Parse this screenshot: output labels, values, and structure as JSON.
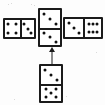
{
  "figure": {
    "background_color": "#fdfdfd",
    "ink_color": "#1b1b1b",
    "pip_color": "#101010"
  },
  "dominoes": [
    {
      "id": "left-domino",
      "name": "left-domino",
      "orientation": "horizontal",
      "position": "cross-left",
      "x": 3,
      "y": 18,
      "width": 33,
      "height": 21,
      "halves": [
        {
          "name": "left-domino-half-a",
          "pips": 4,
          "pattern": "four",
          "label": "4"
        },
        {
          "name": "left-domino-half-b",
          "pips": 3,
          "pattern": "three",
          "label": "3"
        }
      ],
      "value": "4-3",
      "total": 7
    },
    {
      "id": "center-domino",
      "name": "center-domino",
      "orientation": "vertical",
      "position": "cross-center",
      "x": 38,
      "y": 8,
      "width": 24,
      "height": 39,
      "halves": [
        {
          "name": "center-domino-half-a",
          "pips": 3,
          "pattern": "three",
          "label": "3"
        },
        {
          "name": "center-domino-half-b",
          "pips": 3,
          "pattern": "three",
          "label": "3"
        }
      ],
      "value": "3-3",
      "total": 6
    },
    {
      "id": "right-domino",
      "name": "right-domino",
      "orientation": "horizontal",
      "position": "cross-right",
      "x": 63,
      "y": 17,
      "width": 40,
      "height": 22,
      "halves": [
        {
          "name": "right-domino-half-a",
          "pips": 3,
          "pattern": "three",
          "label": "3"
        },
        {
          "name": "right-domino-half-b",
          "pips": 6,
          "pattern": "six",
          "label": "6"
        }
      ],
      "value": "3-6",
      "total": 9
    },
    {
      "id": "bottom-domino",
      "name": "bottom-domino",
      "orientation": "vertical",
      "position": "answer-below",
      "x": 39,
      "y": 64,
      "width": 24,
      "height": 39,
      "halves": [
        {
          "name": "bottom-domino-half-a",
          "pips": 3,
          "pattern": "three",
          "label": "3"
        },
        {
          "name": "bottom-domino-half-b",
          "pips": 5,
          "pattern": "five",
          "label": "5"
        }
      ],
      "value": "3-5",
      "total": 8
    }
  ],
  "arrow": {
    "name": "up-arrow",
    "direction": "up",
    "x": 47,
    "y": 47,
    "width": 9,
    "height": 17,
    "from": "bottom-domino",
    "to": "center-domino"
  },
  "pip_layouts": {
    "three": [
      [
        22,
        22
      ],
      [
        50,
        50
      ],
      [
        78,
        78
      ]
    ],
    "four": [
      [
        24,
        24
      ],
      [
        76,
        24
      ],
      [
        24,
        76
      ],
      [
        76,
        76
      ]
    ],
    "five": [
      [
        24,
        24
      ],
      [
        76,
        24
      ],
      [
        50,
        50
      ],
      [
        24,
        76
      ],
      [
        76,
        76
      ]
    ],
    "six": [
      [
        22,
        26
      ],
      [
        50,
        26
      ],
      [
        78,
        26
      ],
      [
        22,
        74
      ],
      [
        50,
        74
      ],
      [
        78,
        74
      ]
    ]
  },
  "speckles": [
    {
      "x": 8,
      "y": 4
    },
    {
      "x": 11,
      "y": 3
    },
    {
      "x": 31,
      "y": 4
    },
    {
      "x": 34,
      "y": 5
    },
    {
      "x": 96,
      "y": 52
    },
    {
      "x": 66,
      "y": 96
    },
    {
      "x": 14,
      "y": 99
    }
  ]
}
